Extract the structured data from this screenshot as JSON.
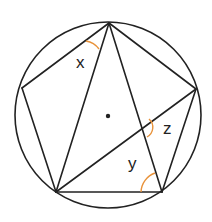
{
  "diagram": {
    "type": "inscribed-pentagon-angles",
    "colors": {
      "stroke": "#222222",
      "angle_arc": "#E8923A",
      "background": "#ffffff"
    },
    "circle": {
      "cx": 108,
      "cy": 115,
      "r": 93
    },
    "center_dot": {
      "cx": 108,
      "cy": 116,
      "r": 2.2
    },
    "vertices": {
      "T": {
        "x": 109,
        "y": 23
      },
      "L": {
        "x": 22,
        "y": 88
      },
      "R": {
        "x": 196,
        "y": 89
      },
      "BL": {
        "x": 56,
        "y": 192
      },
      "BR": {
        "x": 162,
        "y": 192
      }
    },
    "segments": [
      [
        "T",
        "L"
      ],
      [
        "L",
        "BL"
      ],
      [
        "BL",
        "BR"
      ],
      [
        "BR",
        "R"
      ],
      [
        "R",
        "T"
      ],
      [
        "T",
        "BL"
      ],
      [
        "T",
        "BR"
      ],
      [
        "BL",
        "R"
      ]
    ],
    "angles": [
      {
        "label": "x",
        "label_x": 76,
        "label_y": 68
      },
      {
        "label": "z",
        "label_x": 163,
        "label_y": 134
      },
      {
        "label": "y",
        "label_x": 128,
        "label_y": 169
      }
    ]
  }
}
